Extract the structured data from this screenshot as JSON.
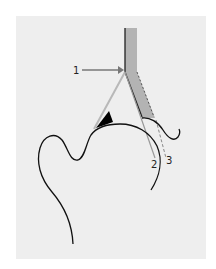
{
  "diagram": {
    "type": "anatomical-schematic",
    "labels": {
      "one": "1",
      "two": "2",
      "three": "3"
    },
    "colors": {
      "outer_background": "#ffffff",
      "panel_background": "#eeeeee",
      "bone_outline": "#111111",
      "grey_wedge": "#b3b3b3",
      "light_line": "#b8b8b8",
      "arrow": "#777777",
      "angle_marker": "#000000"
    }
  }
}
